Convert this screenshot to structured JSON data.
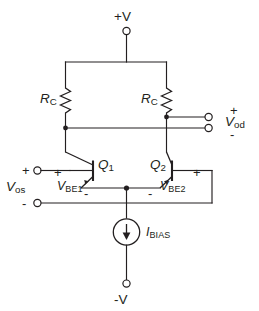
{
  "diagram": {
    "ink_color": "#231f20",
    "background": "#ffffff"
  },
  "supplies": {
    "positive": {
      "label": "+V",
      "terminal": "open-circle"
    },
    "negative": {
      "label": "-V",
      "terminal": "open-circle"
    }
  },
  "resistors": [
    {
      "id": "RC-left",
      "label_main": "R",
      "label_sub": "C"
    },
    {
      "id": "RC-right",
      "label_main": "R",
      "label_sub": "C"
    }
  ],
  "transistors": [
    {
      "id": "Q1",
      "label_main": "Q",
      "label_sub": "1",
      "vbe_main": "V",
      "vbe_sub": "BE1",
      "polarity_near_base": "+",
      "polarity_near_emitter": "-"
    },
    {
      "id": "Q2",
      "label_main": "Q",
      "label_sub": "2",
      "vbe_main": "V",
      "vbe_sub": "BE2",
      "polarity_near_base": "+",
      "polarity_near_emitter": "-"
    }
  ],
  "current_source": {
    "label_main": "I",
    "label_sub": "BIAS",
    "direction": "down"
  },
  "input_port": {
    "label_main": "V",
    "label_sub": "os",
    "plus_sign": "+",
    "minus_sign": "-",
    "terminals": 2
  },
  "output_port": {
    "label_main": "V",
    "label_sub": "od",
    "plus_sign": "+",
    "minus_sign": "-",
    "terminals": 2
  },
  "base_signs": {
    "q1_plus": "+",
    "q1_minus": "-",
    "q2_plus": "+",
    "q2_minus": "-"
  }
}
